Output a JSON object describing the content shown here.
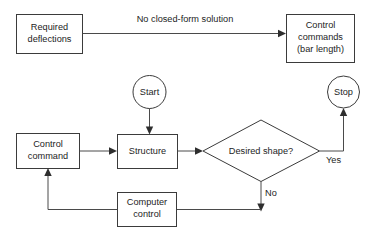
{
  "diagram": {
    "canvas": {
      "width": 376,
      "height": 238,
      "background": "#ffffff"
    },
    "stroke_color": "#3b3b3b",
    "text_color": "#1d1d1d",
    "nodes": {
      "required_deflections": {
        "shape": "rectangle",
        "line1": "Required",
        "line2": "deflections"
      },
      "control_commands": {
        "shape": "rectangle",
        "line1": "Control",
        "line2": "commands",
        "line3": "(bar length)"
      },
      "start": {
        "shape": "ellipse",
        "label": "Start"
      },
      "stop": {
        "shape": "ellipse",
        "label": "Stop"
      },
      "control_command": {
        "shape": "rectangle",
        "line1": "Control",
        "line2": "command"
      },
      "structure": {
        "shape": "rectangle",
        "label": "Structure"
      },
      "desired_shape": {
        "shape": "diamond",
        "label": "Desired shape?"
      },
      "computer_control": {
        "shape": "rectangle",
        "line1": "Computer",
        "line2": "control"
      }
    },
    "edge_labels": {
      "no_closed_form": "No closed-form solution",
      "yes": "Yes",
      "no": "No"
    }
  }
}
